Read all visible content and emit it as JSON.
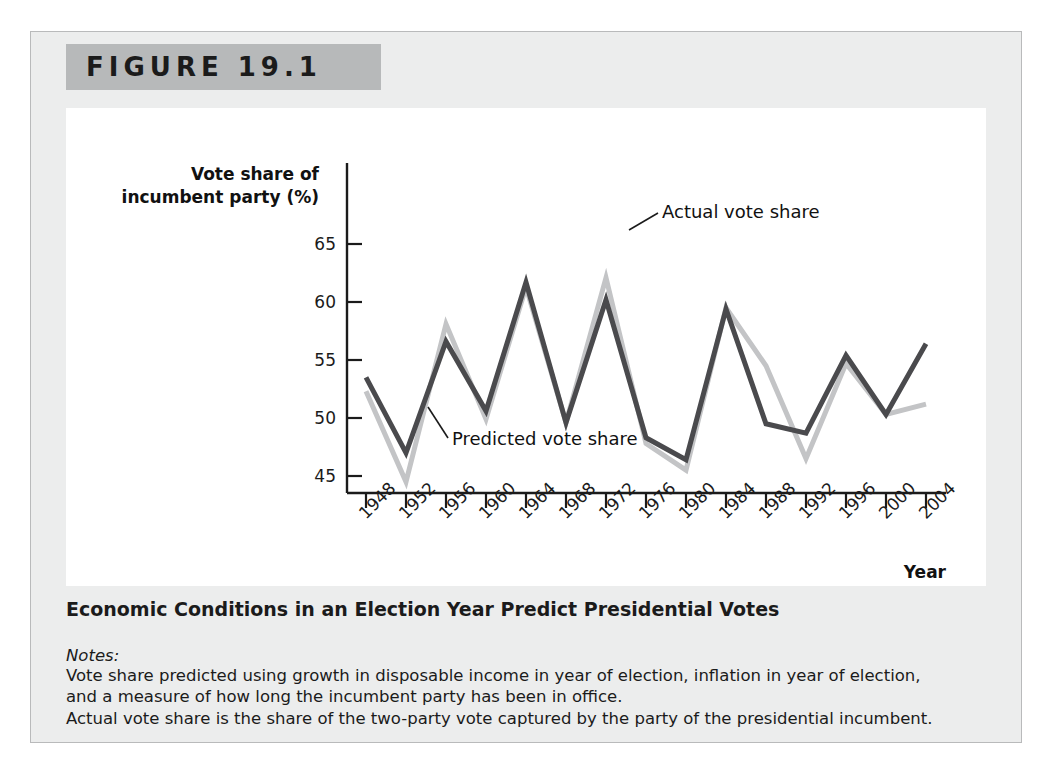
{
  "figure": {
    "label": "FIGURE 19.1",
    "caption": "Economic Conditions in an Election Year Predict Presidential Votes",
    "notes_heading": "Notes:",
    "notes": [
      "Vote share predicted using growth in disposable income in year of election, inflation in year of election,",
      "and a measure of how long the incumbent party has been in office.",
      "Actual vote share is the share of the two-party vote captured by the party of the presidential incumbent."
    ]
  },
  "colors": {
    "panel_background": "#eceded",
    "header_bar": "#b7b9ba",
    "plot_background": "#ffffff",
    "axis": "#1b1b1b",
    "predicted_line": "#4a4a4d",
    "actual_line": "#c3c4c6",
    "text": "#1b1b1b"
  },
  "chart_data": {
    "type": "line",
    "title": "",
    "ylabel_line1": "Vote share of",
    "ylabel_line2": "incumbent party (%)",
    "xlabel": "Year",
    "ylim": [
      43,
      67
    ],
    "yticks": [
      45,
      50,
      55,
      60,
      65
    ],
    "ytick_labels": [
      "45",
      "50",
      "55",
      "60",
      "65"
    ],
    "grid": false,
    "legend_position": "inline-annotation",
    "categories": [
      1948,
      1952,
      1956,
      1960,
      1964,
      1968,
      1972,
      1976,
      1980,
      1984,
      1988,
      1992,
      1996,
      2000,
      2004
    ],
    "xtick_labels": [
      "1948",
      "1952",
      "1956",
      "1960",
      "1964",
      "1968",
      "1972",
      "1976",
      "1980",
      "1984",
      "1988",
      "1992",
      "1996",
      "2000",
      "2004"
    ],
    "series": [
      {
        "name": "Predicted vote share",
        "color": "#4a4a4d",
        "values": [
          53.5,
          47.0,
          56.6,
          50.6,
          61.7,
          49.6,
          60.2,
          48.3,
          46.4,
          59.4,
          49.5,
          48.7,
          55.4,
          50.3,
          56.4
        ]
      },
      {
        "name": "Actual vote share",
        "color": "#c3c4c6",
        "values": [
          52.3,
          44.5,
          58.1,
          49.9,
          61.3,
          49.6,
          62.1,
          47.8,
          45.5,
          59.5,
          54.5,
          46.5,
          54.7,
          50.3,
          51.2
        ]
      }
    ],
    "annotations": [
      {
        "text": "Actual vote share",
        "target_year": 1972,
        "target_value": 62.1
      },
      {
        "text": "Predicted vote share",
        "target_year": 1968,
        "target_value": 49.6
      }
    ]
  }
}
